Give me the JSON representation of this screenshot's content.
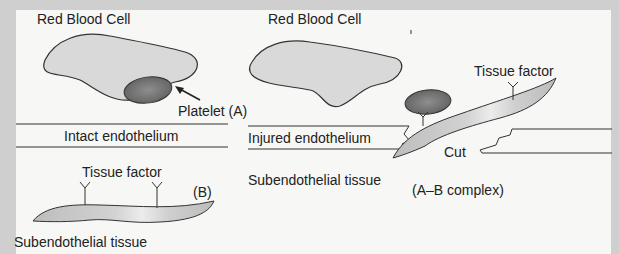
{
  "figure": {
    "colors": {
      "frame": "#cfcfcf",
      "panel": "#f7f7f5",
      "outline": "#333333",
      "cell_fill": "#d9d9d9",
      "platelet_fill": "#7a7a7a",
      "tissue_fill": "#c9c9c9",
      "text": "#222222"
    },
    "panel_left": {
      "rbc_label": "Red Blood Cell",
      "platelet_label": "Platelet (A)",
      "endothelium_label": "Intact endothelium",
      "tissue_factor_label": "Tissue factor",
      "b_label": "(B)",
      "subendothelial_label": "Subendothelial tissue"
    },
    "panel_right": {
      "rbc_label": "Red Blood Cell",
      "tissue_factor_label": "Tissue factor",
      "endothelium_label": "Injured endothelium",
      "cut_label": "Cut",
      "subendothelial_label": "Subendothelial tissue",
      "complex_label": "(A–B complex)"
    }
  }
}
